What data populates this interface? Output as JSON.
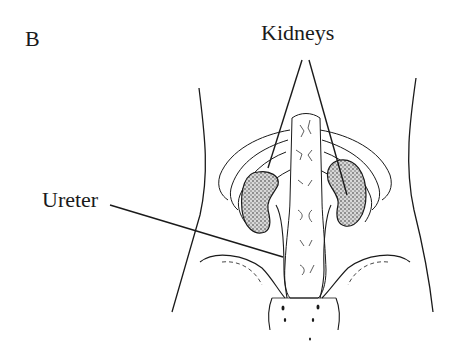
{
  "figure": {
    "panel_letter": "B",
    "labels": {
      "kidneys": "Kidneys",
      "ureter": "Ureter"
    },
    "colors": {
      "ink": "#1a1a1a",
      "background": "#ffffff",
      "kidney_fill": "#8a8a8a"
    }
  }
}
